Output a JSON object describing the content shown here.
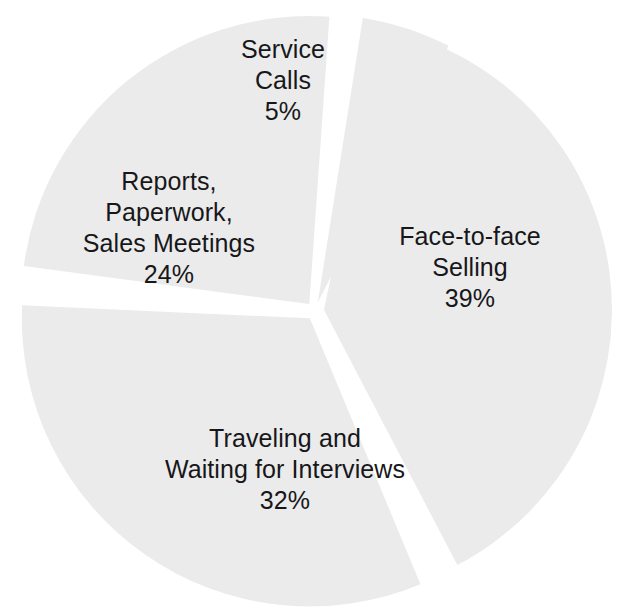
{
  "page": {
    "background_color": "#ffffff"
  },
  "chart_data": {
    "type": "pie",
    "title": "",
    "subtitle": "",
    "xlabel": "",
    "ylabel": "",
    "legend_position": "none",
    "grid": false,
    "exploded": true,
    "slice_fill_color": "#ebebeb",
    "gap_color": "#ffffff",
    "label_color": "#17171a",
    "labels_inside_slices": true,
    "units": "percent",
    "total": 100,
    "categories": [
      "Face-to-face Selling",
      "Traveling and Waiting for Interviews",
      "Reports, Paperwork, Sales Meetings",
      "Service Calls"
    ],
    "values": [
      39,
      32,
      24,
      5
    ],
    "slices": [
      {
        "id": "face-to-face-selling",
        "label_lines": [
          "Face-to-face",
          "Selling"
        ],
        "value": 39,
        "value_text": "39%",
        "start_angle_deg": 12,
        "end_angle_deg": 152.4,
        "label_x": 470,
        "label_y": 245,
        "fill": "#ebebeb"
      },
      {
        "id": "traveling-and-waiting",
        "label_lines": [
          "Traveling and",
          "Waiting for Interviews"
        ],
        "value": 32,
        "value_text": "32%",
        "start_angle_deg": 157.4,
        "end_angle_deg": 272.6,
        "label_x": 285,
        "label_y": 447,
        "fill": "#ebebeb"
      },
      {
        "id": "reports-paperwork-sales-meetings",
        "label_lines": [
          "Reports,",
          "Paperwork,",
          "Sales Meetings"
        ],
        "value": 24,
        "value_text": "24%",
        "start_angle_deg": 277.6,
        "end_angle_deg": 364.0,
        "label_x": 169,
        "label_y": 190,
        "fill": "#ebebeb"
      },
      {
        "id": "service-calls",
        "label_lines": [
          "Service",
          "Calls"
        ],
        "value": 5,
        "value_text": "5%",
        "start_angle_deg": 369.0,
        "end_angle_deg": 387.0,
        "label_x": 283,
        "label_y": 58,
        "fill": "#ebebeb"
      }
    ]
  },
  "geometry": {
    "center_x": 315,
    "center_y": 311,
    "radius": 288,
    "explode_offset": 9
  }
}
